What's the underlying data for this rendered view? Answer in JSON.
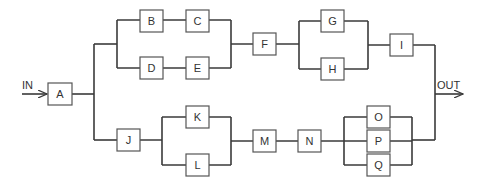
{
  "diagram": {
    "type": "reliability-block-diagram",
    "input_label": "IN",
    "output_label": "OUT",
    "colors": {
      "line": "#3a3a3a",
      "box_border": "#555555",
      "text": "#333333",
      "background": "#ffffff"
    },
    "blocks": {
      "A": "A",
      "B": "B",
      "C": "C",
      "D": "D",
      "E": "E",
      "F": "F",
      "G": "G",
      "H": "H",
      "I": "I",
      "J": "J",
      "K": "K",
      "L": "L",
      "M": "M",
      "N": "N",
      "O": "O",
      "P": "P",
      "Q": "Q"
    },
    "structure": {
      "series": [
        "A",
        "parallel(upper_path, lower_path)"
      ],
      "upper_path": [
        "parallel(series(B,C), series(D,E))",
        "F",
        "parallel(G,H)",
        "I"
      ],
      "lower_path": [
        "J",
        "parallel(K,L)",
        "M",
        "N",
        "parallel(O,P,Q)"
      ]
    }
  }
}
